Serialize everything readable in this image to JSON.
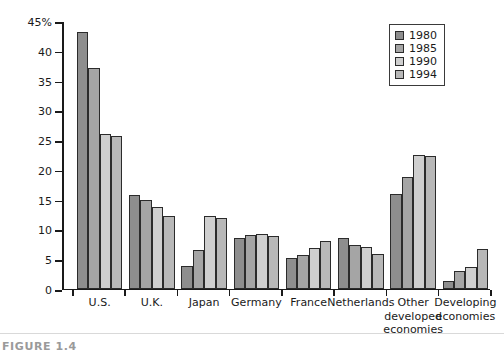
{
  "caption": "FIGURE 1.4",
  "legend": {
    "position": "top-right",
    "entries": [
      {
        "label": "1980",
        "color": "#8e8e8e"
      },
      {
        "label": "1985",
        "color": "#a5a5a5"
      },
      {
        "label": "1990",
        "color": "#cfcfcf"
      },
      {
        "label": "1994",
        "color": "#b8b8b8"
      }
    ]
  },
  "chart_data": {
    "type": "bar",
    "title": "",
    "subtitle": "",
    "xlabel": "",
    "ylabel": "",
    "ylim": [
      0,
      45
    ],
    "ytick_labels": [
      "0",
      "5",
      "10",
      "15",
      "20",
      "25",
      "30",
      "35",
      "40",
      "45%"
    ],
    "yticks": [
      0,
      5,
      10,
      15,
      20,
      25,
      30,
      35,
      40,
      45
    ],
    "grid": false,
    "categories": [
      "U.S.",
      "U.K.",
      "Japan",
      "Germany",
      "France",
      "Netherlands",
      "Other\ndeveloped\neconomies",
      "Developing\neconomies"
    ],
    "series": [
      {
        "name": "1980",
        "color": "#8e8e8e",
        "values": [
          43.0,
          15.7,
          3.8,
          8.5,
          5.2,
          8.5,
          15.9,
          1.2
        ]
      },
      {
        "name": "1985",
        "color": "#a5a5a5",
        "values": [
          37.0,
          14.9,
          6.5,
          9.0,
          5.7,
          7.3,
          18.8,
          2.9
        ]
      },
      {
        "name": "1990",
        "color": "#cfcfcf",
        "values": [
          26.0,
          13.7,
          12.1,
          9.2,
          6.8,
          6.9,
          22.4,
          3.6
        ]
      },
      {
        "name": "1994",
        "color": "#b8b8b8",
        "values": [
          25.6,
          12.1,
          11.8,
          8.8,
          7.9,
          5.8,
          22.2,
          6.6
        ]
      }
    ]
  }
}
